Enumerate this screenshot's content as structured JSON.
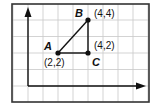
{
  "diagram": {
    "type": "coordinate-grid-triangle",
    "grid": {
      "x_units": 8,
      "y_units": 6
    },
    "points": [
      {
        "name": "A",
        "coord_label": "(2,2)",
        "x": 2,
        "y": 2
      },
      {
        "name": "B",
        "coord_label": "(4,4)",
        "x": 4,
        "y": 4
      },
      {
        "name": "C",
        "coord_label": "(4,2)",
        "x": 4,
        "y": 2
      }
    ],
    "segments": [
      [
        "A",
        "B"
      ],
      [
        "B",
        "C"
      ],
      [
        "C",
        "A"
      ]
    ],
    "colors": {
      "grid": "#c8c8c8",
      "ink": "#111111",
      "border": "#333333"
    }
  }
}
